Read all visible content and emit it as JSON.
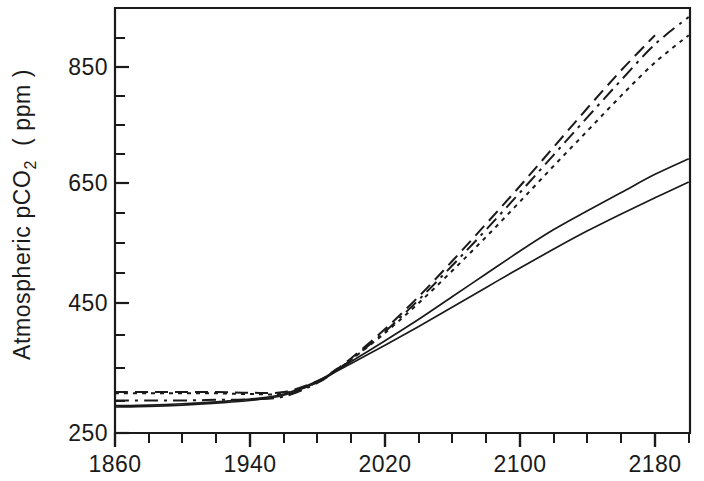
{
  "chart_data": {
    "type": "line",
    "title": "",
    "xlabel": "",
    "ylabel": "Atmospheric pCO2 (ppm)",
    "ylabel_main": "Atmospheric  pCO",
    "ylabel_sub": "2",
    "ylabel_unit": "( ppm )",
    "xlim": [
      1860,
      2200
    ],
    "ylim": [
      250,
      900
    ],
    "grid": false,
    "legend": "none",
    "x_ticks_major": [
      1860,
      1940,
      2020,
      2100,
      2180
    ],
    "x_tick_labels": [
      "1860",
      "1940",
      "2020",
      "2100",
      "2180"
    ],
    "x_tick_minor_step": 20,
    "y_ticks_major": [
      250,
      450,
      650,
      850
    ],
    "y_tick_labels": [
      "250",
      "450",
      "650",
      "850"
    ],
    "y_tick_minor_step": 50,
    "series": [
      {
        "name": "scenario-solid-upper",
        "style": "solid",
        "x": [
          1860,
          1880,
          1900,
          1920,
          1940,
          1960,
          1980,
          1990,
          2000,
          2020,
          2040,
          2060,
          2080,
          2100,
          2120,
          2140,
          2160,
          2180,
          2200
        ],
        "values": [
          292,
          293,
          295,
          298,
          302,
          310,
          330,
          345,
          360,
          392,
          425,
          460,
          495,
          530,
          563,
          592,
          620,
          648,
          672
        ]
      },
      {
        "name": "scenario-solid-lower",
        "style": "solid",
        "x": [
          1860,
          1880,
          1900,
          1920,
          1940,
          1960,
          1980,
          1990,
          2000,
          2020,
          2040,
          2060,
          2080,
          2100,
          2120,
          2140,
          2160,
          2180,
          2200
        ],
        "values": [
          290,
          291,
          293,
          296,
          300,
          308,
          328,
          343,
          357,
          385,
          414,
          444,
          474,
          504,
          533,
          561,
          587,
          612,
          636
        ]
      },
      {
        "name": "scenario-dashed-long",
        "style": "dashed-long",
        "x": [
          1860,
          1880,
          1900,
          1920,
          1940,
          1960,
          1980,
          1990,
          2000,
          2020,
          2040,
          2060,
          2080,
          2100,
          2120,
          2140,
          2160,
          2180,
          2200
        ],
        "values": [
          313,
          313,
          313,
          313,
          312,
          313,
          330,
          346,
          365,
          410,
          460,
          515,
          572,
          630,
          690,
          750,
          808,
          862,
          905
        ]
      },
      {
        "name": "scenario-dash-dot",
        "style": "dash-dot",
        "x": [
          1860,
          1880,
          1900,
          1920,
          1940,
          1960,
          1980,
          1990,
          2000,
          2020,
          2040,
          2060,
          2080,
          2100,
          2120,
          2140,
          2160,
          2180,
          2200
        ],
        "values": [
          300,
          300,
          300,
          301,
          302,
          306,
          327,
          344,
          363,
          406,
          455,
          508,
          563,
          620,
          678,
          736,
          793,
          848,
          890
        ]
      },
      {
        "name": "scenario-dotted",
        "style": "dotted",
        "x": [
          1860,
          1880,
          1900,
          1920,
          1940,
          1960,
          1980,
          1990,
          2000,
          2020,
          2040,
          2060,
          2080,
          2100,
          2120,
          2140,
          2160,
          2180,
          2200
        ],
        "values": [
          311,
          311,
          311,
          311,
          310,
          311,
          328,
          345,
          363,
          404,
          450,
          500,
          552,
          606,
          661,
          715,
          769,
          820,
          862
        ]
      }
    ]
  }
}
